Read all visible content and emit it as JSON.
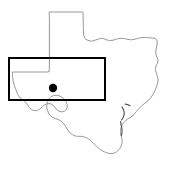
{
  "figure": {
    "kind": "map-figure",
    "width": 171,
    "height": 171,
    "background_color": "#ffffff",
    "region_name": "Texas"
  },
  "layers": {
    "state_outline": {
      "name": "Texas state boundary",
      "stroke_color": "#8c8c8c",
      "stroke_width": 0.9,
      "fill": "none"
    },
    "coast_detail": {
      "name": "Gulf coast barrier island detail",
      "stroke_color": "#4a4a4a",
      "stroke_width": 1.1
    },
    "bounding_box": {
      "name": "Study area rectangle",
      "stroke_color": "#000000",
      "stroke_width": 2.2,
      "fill": "none",
      "x": 9,
      "y": 58,
      "width": 96,
      "height": 42
    },
    "point_marker": {
      "name": "Site location dot",
      "fill_color": "#000000",
      "cx": 53,
      "cy": 88,
      "r": 4.2
    }
  },
  "geometry": {
    "texas_outline": "M 49.5 12.0 L 83.0 12.0 L 83.2 20.0 L 83.4 28.5 L 83.6 35.0 L 85.0 38.5 L 88.0 40.5 L 91.5 41.2 L 95.0 40.2 L 98.5 39.0 L 101.5 38.2 L 104.0 38.8 L 107.0 40.0 L 110.5 40.6 L 114.0 40.0 L 117.5 38.8 L 121.0 38.2 L 124.5 38.6 L 128.0 39.4 L 131.5 39.8 L 135.0 39.2 L 138.5 38.2 L 142.0 37.6 L 145.5 37.4 L 149.0 37.8 L 152.5 38.0 L 155.5 38.4 L 157.2 41.0 L 157.0 45.0 L 156.2 49.0 L 155.6 53.0 L 156.6 56.5 L 158.0 59.5 L 157.6 63.0 L 156.0 66.0 L 155.4 69.5 L 156.2 73.0 L 157.4 76.5 L 158.2 80.0 L 157.6 83.5 L 156.4 87.0 L 155.0 90.5 L 153.2 94.0 L 151.0 97.5 L 148.4 100.5 L 145.2 103.0 L 142.0 105.5 L 139.0 108.5 L 136.4 111.5 L 134.0 114.5 L 131.0 117.0 L 127.6 119.0 L 124.6 121.5 L 122.4 124.5 L 121.0 128.0 L 120.4 131.5 L 120.8 135.0 L 121.8 138.5 L 122.2 142.0 L 121.4 145.5 L 119.8 148.5 L 117.6 151.0 L 115.0 152.8 L 112.0 153.6 L 108.8 153.4 L 105.6 152.4 L 102.6 151.0 L 99.8 149.2 L 97.2 147.0 L 94.8 144.6 L 92.4 142.2 L 90.0 140.0 L 87.4 138.2 L 84.6 137.0 L 81.6 136.4 L 78.4 136.4 L 75.4 136.0 L 72.6 134.8 L 70.2 133.0 L 68.2 130.6 L 66.6 128.0 L 65.0 125.4 L 63.2 123.0 L 61.0 121.0 L 58.4 119.6 L 55.6 118.6 L 52.8 117.4 L 50.4 115.6 L 48.6 113.2 L 47.4 110.4 L 46.8 107.4 L 46.8 104.4 L 47.6 101.4 L 49.0 98.8 L 51.0 96.8 L 53.4 95.6 L 56.0 95.2 L 58.6 95.6 L 61.0 96.6 L 63.2 98.2 L 65.0 100.2 L 66.4 102.4 L 67.2 104.8 L 67.2 107.2 L 66.4 109.4 L 64.8 111.0 L 62.6 111.8 L 60.2 111.6 L 58.0 110.6 L 56.2 109.0 L 54.8 107.0 L 53.2 105.2 L 51.2 104.0 L 49.0 103.6 L 46.6 104.0 L 44.4 105.0 L 42.4 106.6 L 40.6 108.4 L 38.6 109.8 L 36.4 110.6 L 34.0 110.6 L 31.8 109.8 L 30.0 108.4 L 28.6 106.6 L 27.4 104.6 L 26.0 102.6 L 24.2 101.0 L 22.2 99.6 L 20.2 98.0 L 18.6 96.0 L 17.4 93.6 L 16.4 91.0 L 15.4 88.4 L 14.4 85.8 L 13.6 83.0 L 13.0 80.2 L 12.6 77.4 L 12.4 74.6 L 12.4 72.0 L 16.0 72.0 L 20.0 72.0 L 24.0 72.0 L 28.0 72.0 L 32.0 72.0 L 36.0 72.0 L 40.0 72.0 L 44.0 72.0 L 47.0 72.0 L 49.2 71.6 L 49.4 66.0 L 49.4 58.0 L 49.4 48.0 L 49.4 38.0 L 49.4 28.0 L 49.4 20.0 Z",
    "gulf_detail_strokes": [
      "M 122.0 107.0 L 123.4 109.6 L 124.2 112.4 L 124.0 115.2 L 123.0 117.8 L 121.6 120.0",
      "M 120.6 121.6 L 121.0 124.4 L 121.6 127.2 L 122.0 130.0 L 122.0 132.8 L 121.4 135.4",
      "M 125.0 104.0 L 127.6 104.6 L 130.0 105.8"
    ]
  },
  "annotations": {
    "bbox_label": "",
    "dot_label": "",
    "title": ""
  }
}
